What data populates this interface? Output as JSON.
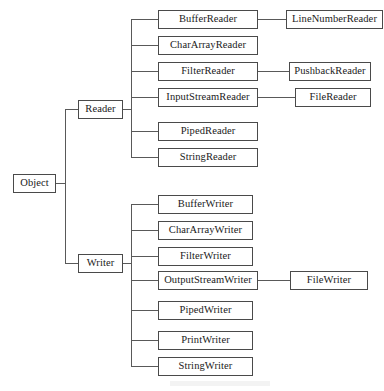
{
  "diagram": {
    "type": "tree",
    "colors": {
      "background": "#ffffff",
      "box_border": "#4a4a4a",
      "box_fill": "#ffffff",
      "text": "#1a1a1a",
      "edge": "#595959"
    },
    "root": {
      "label": "Object"
    },
    "branches": [
      {
        "label": "Reader",
        "children": [
          {
            "label": "BufferReader",
            "children": [
              {
                "label": "LineNumberReader"
              }
            ]
          },
          {
            "label": "CharArrayReader",
            "children": []
          },
          {
            "label": "FilterReader",
            "children": [
              {
                "label": "PushbackReader"
              }
            ]
          },
          {
            "label": "InputStreamReader",
            "children": [
              {
                "label": "FileReader"
              }
            ]
          },
          {
            "label": "PipedReader",
            "children": []
          },
          {
            "label": "StringReader",
            "children": []
          }
        ]
      },
      {
        "label": "Writer",
        "children": [
          {
            "label": "BufferWriter",
            "children": []
          },
          {
            "label": "CharArrayWriter",
            "children": []
          },
          {
            "label": "FilterWriter",
            "children": []
          },
          {
            "label": "OutputStreamWriter",
            "children": [
              {
                "label": "FileWriter"
              }
            ]
          },
          {
            "label": "PipedWriter",
            "children": []
          },
          {
            "label": "PrintWriter",
            "children": []
          },
          {
            "label": "StringWriter",
            "children": []
          }
        ]
      }
    ]
  }
}
